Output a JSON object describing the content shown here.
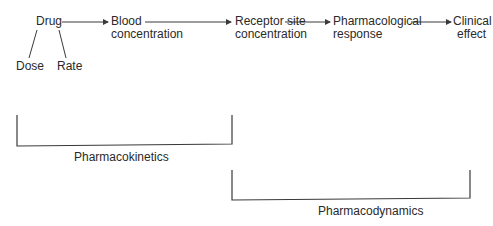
{
  "nodes": {
    "drug": "Drug",
    "dose": "Dose",
    "rate": "Rate",
    "blood_1": "Blood",
    "blood_2": "concentration",
    "receptor_1": "Receptor site",
    "receptor_2": "concentration",
    "pharmacological_1": "Pharmacological",
    "pharmacological_2": "response",
    "clinical_1": "Clinical",
    "clinical_2": "effect"
  },
  "brackets": {
    "pharmacokinetics": "Pharmacokinetics",
    "pharmacodynamics": "Pharmacodynamics"
  },
  "colors": {
    "line": "#3a3a3a",
    "text": "#2a2a2a",
    "background": "#ffffff"
  }
}
